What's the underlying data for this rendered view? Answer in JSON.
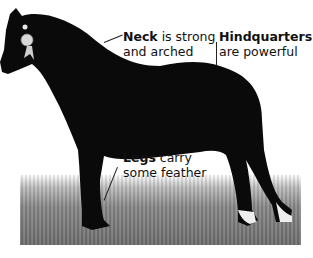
{
  "image": {
    "subject": "black horse standing in profile on grass",
    "background_color": "#ffffff",
    "horse_color": "#0a0a0a",
    "grass_color": "#7a7a7a"
  },
  "annotations": [
    {
      "id": "neck",
      "bold": "Neck",
      "rest": " is strong",
      "line2": "and arched"
    },
    {
      "id": "hindquarters",
      "bold": "Hindquarters",
      "rest": "",
      "line2": "are powerful"
    },
    {
      "id": "legs",
      "bold": "Legs",
      "rest": " carry",
      "line2": "some feather"
    }
  ]
}
